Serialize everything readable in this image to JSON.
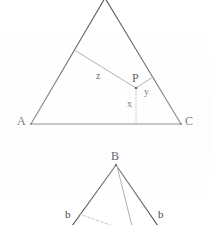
{
  "figure": {
    "background_color": "#ffffff",
    "stroke_color": "#56565e",
    "light_stroke_color": "#9a9aa2",
    "dotted_stroke_color": "#a8a8b0",
    "label_color": "#34343a",
    "upper_triangle": {
      "name": "triangle-ABC",
      "vertices": [
        {
          "id": "apex",
          "label": "",
          "x": 105,
          "y": 0
        },
        {
          "id": "A",
          "label": "A",
          "x": 31,
          "y": 124
        },
        {
          "id": "C",
          "label": "C",
          "x": 181,
          "y": 124
        }
      ],
      "interior_point": {
        "id": "P",
        "label": "P",
        "x": 136,
        "y": 88
      },
      "segments": [
        {
          "id": "z",
          "label": "z",
          "from": "P",
          "to": "side-AB",
          "to_x": 76,
          "to_y": 51,
          "style": "solid-light"
        },
        {
          "id": "y",
          "label": "y",
          "from": "P",
          "to": "side-BC",
          "to_x": 153,
          "to_y": 77,
          "style": "solid-light"
        },
        {
          "id": "x",
          "label": "x",
          "from": "P",
          "to": "base-AC",
          "to_x": 136,
          "to_y": 124,
          "style": "dotted"
        }
      ],
      "labels": {
        "A": "A",
        "C": "C",
        "P": "P",
        "x": "x",
        "y": "y",
        "z": "z"
      }
    },
    "lower_triangle": {
      "name": "triangle-B-partial",
      "apex": {
        "id": "B",
        "label": "B",
        "x": 116,
        "y": 165
      },
      "left_label": "b",
      "right_label": "b",
      "segments": [
        {
          "id": "left-leg",
          "from": "B",
          "to_x": 73,
          "to_y": 225,
          "style": "solid-dark"
        },
        {
          "id": "right-leg",
          "from": "B",
          "to_x": 157,
          "to_y": 225,
          "style": "solid-dark"
        },
        {
          "id": "cevian",
          "from": "B",
          "to_x": 131,
          "to_y": 225,
          "style": "solid-light"
        },
        {
          "id": "left-dash",
          "from_x": 78,
          "from_y": 214,
          "to_x": 112,
          "to_y": 225,
          "style": "dashed-light"
        }
      ]
    }
  }
}
